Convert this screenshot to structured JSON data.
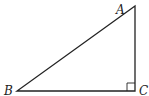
{
  "diagram": {
    "type": "right-triangle",
    "colors": {
      "stroke": "#222222",
      "background": "#ffffff"
    },
    "vertices": [
      {
        "id": "A",
        "label": "A",
        "x": 135,
        "y": 6,
        "label_x": 116,
        "label_y": 14
      },
      {
        "id": "B",
        "label": "B",
        "x": 17,
        "y": 91,
        "label_x": 4,
        "label_y": 95
      },
      {
        "id": "C",
        "label": "C",
        "x": 135,
        "y": 91,
        "label_x": 139,
        "label_y": 95
      }
    ],
    "right_angle_at": "C",
    "right_angle_marker_size": 8
  }
}
